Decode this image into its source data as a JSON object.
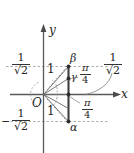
{
  "figure": {
    "axes": {
      "x_label": "x",
      "y_label": "y",
      "origin_label": "O"
    },
    "points": [
      {
        "name": "beta",
        "label": "β"
      },
      {
        "name": "gamma",
        "label": "γ"
      },
      {
        "name": "alpha",
        "label": "α"
      }
    ],
    "angles": [
      {
        "name": "angle-upper",
        "numerator": "π",
        "denominator": "4"
      },
      {
        "name": "angle-lower",
        "numerator": "π",
        "denominator": "4"
      }
    ],
    "value_labels": [
      {
        "name": "y-positive-value",
        "sign": "",
        "numerator": "1",
        "denominator": "√2"
      },
      {
        "name": "y-negative-value",
        "sign": "−",
        "numerator": "1",
        "denominator": "√2"
      },
      {
        "name": "x-value",
        "sign": "",
        "numerator": "1",
        "denominator": "√2"
      }
    ],
    "radius_labels": [
      {
        "name": "radius-upper",
        "text": "1"
      },
      {
        "name": "radius-lower",
        "text": "1"
      }
    ],
    "colors": {
      "ink": "#262626",
      "axis": "#555555",
      "dashed": "#8c8c8c",
      "segment": "#4a4a4a"
    }
  }
}
